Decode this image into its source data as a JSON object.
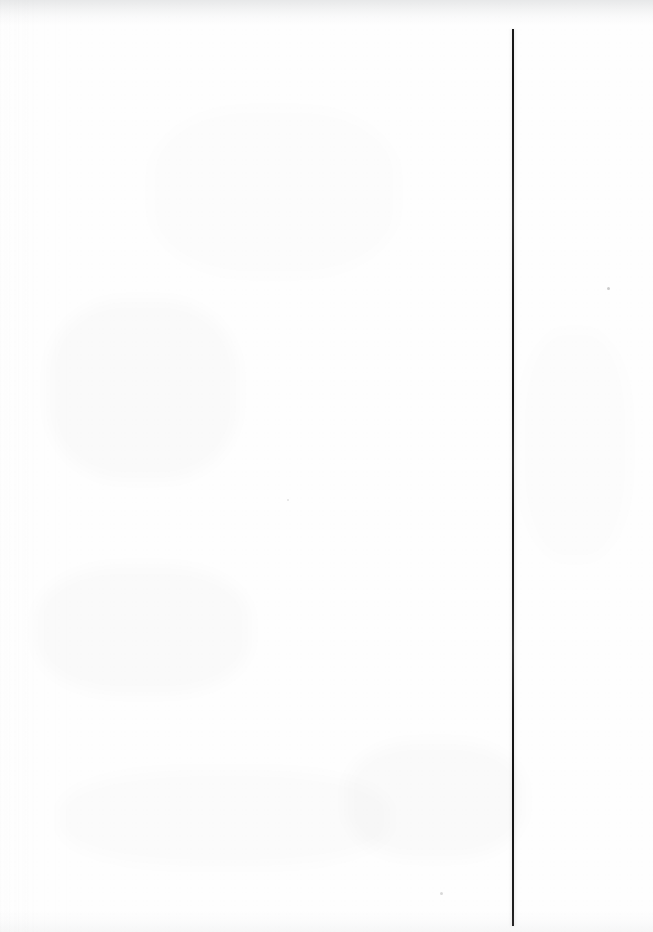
{
  "document": {
    "type": "scanned-page",
    "title": "Scanned blank page with vertical ruled line",
    "width": 653,
    "height": 932,
    "orientation": "portrait",
    "visible_text": "",
    "notes": "Blank scanned sheet; no legible text, headings, numbers, labels or controls are rendered in the pixels."
  },
  "page": {
    "background_color": "#fefefe",
    "paper_tone": "near-white",
    "has_text": false,
    "has_images": false,
    "text_blocks": []
  },
  "marks": {
    "vertical_rule": {
      "name": "vertical-rule",
      "description": "Single dark ruled vertical line near the right side of the page",
      "color": "#161616",
      "x": 512,
      "y_start": 29,
      "y_end": 926,
      "width_px": 2,
      "length_px": 897,
      "orientation": "vertical"
    },
    "specks": [
      {
        "name": "dust-speck-upper-right",
        "x": 607,
        "y": 287,
        "size_px": 3,
        "color": "#333333"
      },
      {
        "name": "dust-speck-lower-center",
        "x": 440,
        "y": 892,
        "size_px": 3,
        "color": "#3a3a3a"
      },
      {
        "name": "dust-speck-mid-left",
        "x": 287,
        "y": 499,
        "size_px": 2,
        "color": "#464646"
      }
    ],
    "show_through": {
      "name": "reverse-side-bleed",
      "description": "Very faint, illegible show-through of content printed on the reverse of the sheet",
      "legible": false,
      "regions": [
        {
          "name": "bleed-upper-left",
          "x": 48,
          "y": 300,
          "width": 190,
          "height": 180
        },
        {
          "name": "bleed-mid-left",
          "x": 36,
          "y": 566,
          "width": 214,
          "height": 128
        },
        {
          "name": "bleed-lower-center",
          "x": 346,
          "y": 742,
          "width": 178,
          "height": 116
        },
        {
          "name": "bleed-upper-center",
          "x": 150,
          "y": 108,
          "width": 248,
          "height": 168
        },
        {
          "name": "bleed-lower-left",
          "x": 60,
          "y": 770,
          "width": 330,
          "height": 96
        },
        {
          "name": "bleed-right-column",
          "x": 520,
          "y": 330,
          "width": 110,
          "height": 230
        }
      ]
    }
  },
  "scan_artifacts": {
    "top_edge_shadow": {
      "name": "top-edge-shadow",
      "height_px": 26,
      "color": "#787d82"
    },
    "bottom_edge_shadow": {
      "name": "bottom-edge-shadow",
      "height_px": 22,
      "color": "#96999e"
    },
    "left_margin_texture": {
      "name": "left-margin-texture",
      "width_px": 34
    },
    "grain": {
      "name": "paper-grain",
      "intensity": "very-low"
    }
  }
}
